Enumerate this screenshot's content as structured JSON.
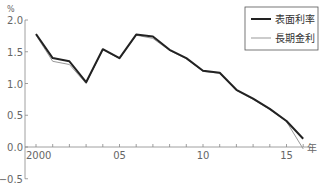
{
  "chart_data": {
    "type": "line",
    "title": "",
    "xlabel": "年",
    "ylabel": "%",
    "ylim": [
      -0.5,
      2.0
    ],
    "grid": false,
    "legend_position": "top-right",
    "x": [
      2000,
      2001,
      2002,
      2003,
      2004,
      2005,
      2006,
      2007,
      2008,
      2009,
      2010,
      2011,
      2012,
      2013,
      2014,
      2015,
      2016
    ],
    "x_tick_labels": [
      {
        "year": 2000,
        "label": "2000"
      },
      {
        "year": 2005,
        "label": "05"
      },
      {
        "year": 2010,
        "label": "10"
      },
      {
        "year": 2015,
        "label": "15"
      }
    ],
    "y_ticks": [
      {
        "value": 2.0,
        "label": "2.0"
      },
      {
        "value": 1.5,
        "label": "1.5"
      },
      {
        "value": 1.0,
        "label": "1.0"
      },
      {
        "value": 0.5,
        "label": "0.5"
      },
      {
        "value": 0.0,
        "label": "0.0"
      },
      {
        "value": -0.5,
        "label": "−0.5"
      }
    ],
    "series": [
      {
        "name": "表面利率",
        "color": "#222222",
        "width": 2,
        "values": [
          1.78,
          1.4,
          1.35,
          1.02,
          1.54,
          1.4,
          1.77,
          1.74,
          1.53,
          1.4,
          1.2,
          1.17,
          0.9,
          0.76,
          0.6,
          0.41,
          0.13
        ]
      },
      {
        "name": "長期金利",
        "color": "#999999",
        "width": 1,
        "values": [
          1.76,
          1.35,
          1.3,
          1.0,
          1.53,
          1.39,
          1.76,
          1.71,
          1.52,
          1.39,
          1.19,
          1.16,
          0.89,
          0.75,
          0.59,
          0.4,
          -0.03
        ]
      }
    ]
  },
  "axis": {
    "y_unit": "%",
    "x_unit": "年"
  },
  "legend": {
    "items": [
      {
        "label": "表面利率",
        "color": "#222222"
      },
      {
        "label": "長期金利",
        "color": "#999999"
      }
    ]
  }
}
